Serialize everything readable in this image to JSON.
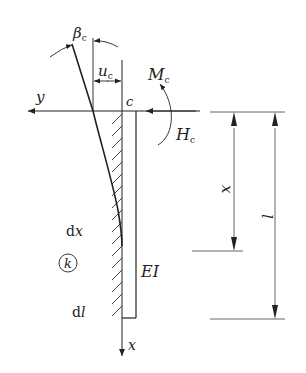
{
  "diagram": {
    "type": "cantilever-pile-deflection",
    "labels": {
      "beta": "β",
      "beta_sub": "c",
      "u": "u",
      "u_sub": "c",
      "M": "M",
      "M_sub": "c",
      "H": "H",
      "H_sub": "c",
      "y_axis": "y",
      "x_axis": "x",
      "origin": "c",
      "dx_d": "d",
      "dx_x": "x",
      "k": "k",
      "EI": "EI",
      "dl_d": "d",
      "dl_l": "l",
      "dim_x": "x",
      "dim_l": "l"
    },
    "colors": {
      "line": "#222222",
      "dim_line": "#555555",
      "background": "#ffffff"
    }
  }
}
